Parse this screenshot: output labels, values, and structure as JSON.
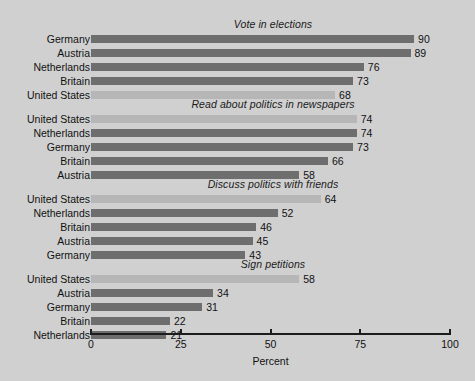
{
  "chart_data": {
    "type": "bar",
    "orientation": "horizontal",
    "title": "",
    "xlabel": "Percent",
    "ylabel": "",
    "xlim": [
      0,
      100
    ],
    "xticks": [
      0,
      25,
      50,
      75,
      100
    ],
    "xtick_labels": [
      "0",
      "25",
      "50",
      "75",
      "100"
    ],
    "grid": false,
    "legend": "none",
    "highlight_category": "United States",
    "colors": {
      "background": "#d0d0d0",
      "bar": "#6e6e6e",
      "bar_highlight": "#b6b6b6",
      "text": "#111111",
      "axis": "#1c1c1c"
    },
    "panels": [
      {
        "title": "Vote in elections",
        "categories": [
          "Germany",
          "Austria",
          "Netherlands",
          "Britain",
          "United States"
        ],
        "values": [
          90,
          89,
          76,
          73,
          68
        ]
      },
      {
        "title": "Read about politics in newspapers",
        "categories": [
          "United States",
          "Netherlands",
          "Germany",
          "Britain",
          "Austria"
        ],
        "values": [
          74,
          74,
          73,
          66,
          58
        ]
      },
      {
        "title": "Discuss politics with friends",
        "categories": [
          "United States",
          "Netherlands",
          "Britain",
          "Austria",
          "Germany"
        ],
        "values": [
          64,
          52,
          46,
          45,
          43
        ]
      },
      {
        "title": "Sign petitions",
        "categories": [
          "United States",
          "Austria",
          "Germany",
          "Britain",
          "Netherlands"
        ],
        "values": [
          58,
          34,
          31,
          22,
          21
        ]
      }
    ]
  }
}
